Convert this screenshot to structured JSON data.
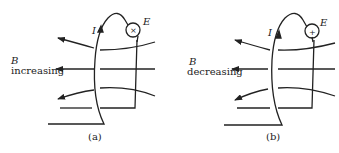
{
  "figure": {
    "panels": [
      {
        "id": "a",
        "caption": "(a)",
        "field_symbol": "B",
        "field_state": "increasing",
        "current_label": "I",
        "emf_label": "E",
        "emf_marker": "×"
      },
      {
        "id": "b",
        "caption": "(b)",
        "field_symbol": "B",
        "field_state": "decreasing",
        "current_label": "I",
        "emf_label": "E",
        "emf_marker": "+"
      }
    ]
  }
}
